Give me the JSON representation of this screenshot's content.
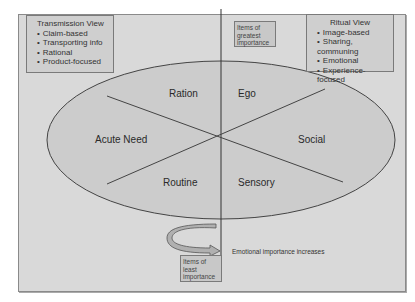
{
  "transmission_view": {
    "title": "Transmission View",
    "items": [
      "Claim-based",
      "Transporting info",
      "Rational",
      "Product-focused"
    ]
  },
  "ritual_view": {
    "title": "Ritual View",
    "items": [
      "Image-based",
      "Sharing, communing",
      "Emotional",
      "Experience-focused"
    ]
  },
  "axis": {
    "top_label": "Items of greatest importance",
    "bottom_label": "Items of least importance",
    "arrow_label": "Emotional importance increases"
  },
  "segments": {
    "top_left": "Ration",
    "top_right": "Ego",
    "left": "Acute Need",
    "right": "Social",
    "bottom_left": "Routine",
    "bottom_right": "Sensory"
  },
  "colors": {
    "background": "#d9d9d9",
    "ellipse_fill": "#cccccc",
    "box_fill": "#cfcfcf",
    "line": "#333333"
  }
}
